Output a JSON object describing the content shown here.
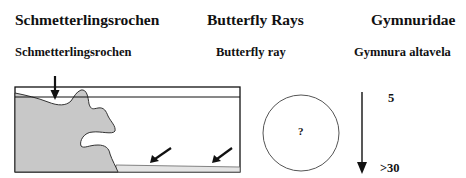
{
  "header": {
    "german_name": "Schmetterlingsrochen",
    "english_name": "Butterfly Rays",
    "family": "Gymnuridae"
  },
  "species": {
    "german_name": "Schmetterlingsrochen",
    "english_name": "Butterfly ray",
    "scientific_name": "Gymnura altavela"
  },
  "habitat_diagram": {
    "description": "Cross-section of coast with reef/rock and sandy bottom; arrows indicate habitat locations",
    "arrows": [
      "surface-shallow",
      "sandy-bottom-1",
      "sandy-bottom-2"
    ]
  },
  "size_indicator": {
    "symbol": "?"
  },
  "depth_range": {
    "min": "5",
    "max": ">30"
  },
  "colors": {
    "land": "#c8c8c8",
    "line": "#111111"
  }
}
